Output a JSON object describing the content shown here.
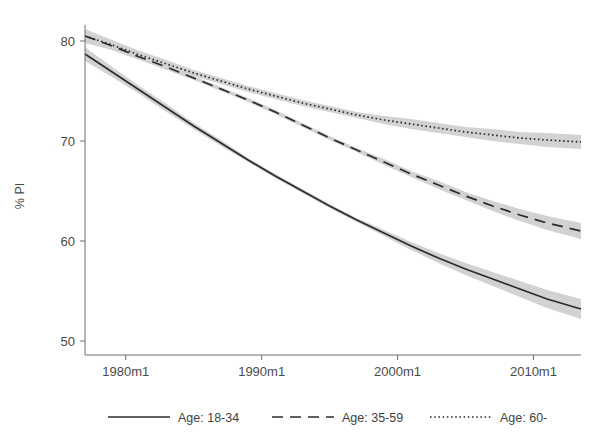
{
  "chart_data": {
    "type": "line",
    "title": "",
    "xlabel": "",
    "ylabel": "% PI",
    "xlim": [
      1977.0,
      2013.5
    ],
    "ylim": [
      48.6,
      81.6
    ],
    "grid": false,
    "legend_position": "bottom",
    "xticks": [
      "1980m1",
      "1990m1",
      "2000m1",
      "2010m1"
    ],
    "xtick_values": [
      1980,
      1990,
      2000,
      2010
    ],
    "yticks": [
      "50",
      "60",
      "70",
      "80"
    ],
    "ytick_values": [
      50,
      60,
      70,
      80
    ],
    "band_note": "shaded 95% confidence bands around each fitted line",
    "band_color": "#d2d2d2",
    "line_color": "#2b2b2b",
    "x": [
      1977.0,
      1979.0,
      1981.0,
      1983.0,
      1985.0,
      1987.0,
      1989.0,
      1991.0,
      1993.0,
      1995.0,
      1997.0,
      1999.0,
      2001.0,
      2003.0,
      2005.0,
      2007.0,
      2009.0,
      2011.0,
      2013.5
    ],
    "series": [
      {
        "name": "Age: 18-34",
        "style": "solid",
        "values": [
          78.7,
          76.9,
          75.1,
          73.3,
          71.5,
          69.8,
          68.1,
          66.5,
          65.0,
          63.5,
          62.1,
          60.8,
          59.5,
          58.3,
          57.2,
          56.2,
          55.2,
          54.2,
          53.2
        ],
        "ci_lower": [
          78.0,
          76.4,
          74.7,
          72.9,
          71.2,
          69.5,
          67.9,
          66.3,
          64.8,
          63.3,
          61.9,
          60.5,
          59.1,
          57.8,
          56.6,
          55.5,
          54.4,
          53.3,
          52.2
        ],
        "ci_upper": [
          79.4,
          77.4,
          75.5,
          73.7,
          71.8,
          70.1,
          68.3,
          66.7,
          65.2,
          63.7,
          62.3,
          61.1,
          59.9,
          58.8,
          57.8,
          56.9,
          56.0,
          55.1,
          54.2
        ]
      },
      {
        "name": "Age: 35-59",
        "style": "dashed",
        "values": [
          80.5,
          79.5,
          78.4,
          77.4,
          76.3,
          75.2,
          74.1,
          72.9,
          71.6,
          70.3,
          69.1,
          67.9,
          66.7,
          65.6,
          64.5,
          63.5,
          62.6,
          61.8,
          61.0
        ],
        "ci_lower": [
          79.9,
          79.1,
          78.1,
          77.1,
          76.1,
          75.0,
          73.9,
          72.7,
          71.4,
          70.1,
          68.9,
          67.6,
          66.4,
          65.2,
          64.1,
          63.0,
          62.0,
          61.1,
          60.2
        ],
        "ci_upper": [
          81.1,
          79.9,
          78.7,
          77.7,
          76.5,
          75.4,
          74.3,
          73.1,
          71.8,
          70.5,
          69.3,
          68.2,
          67.0,
          66.0,
          64.9,
          64.0,
          63.2,
          62.5,
          61.8
        ]
      },
      {
        "name": "Age: 60-",
        "style": "dotted",
        "values": [
          80.5,
          79.6,
          78.6,
          77.7,
          76.8,
          76.0,
          75.2,
          74.5,
          73.8,
          73.2,
          72.6,
          72.1,
          71.7,
          71.3,
          70.9,
          70.6,
          70.3,
          70.1,
          69.9
        ],
        "ci_lower": [
          79.8,
          79.1,
          78.2,
          77.3,
          76.5,
          75.7,
          74.9,
          74.2,
          73.5,
          72.9,
          72.3,
          71.7,
          71.2,
          70.8,
          70.4,
          70.0,
          69.7,
          69.4,
          69.2
        ],
        "ci_upper": [
          81.2,
          80.1,
          79.0,
          78.1,
          77.1,
          76.3,
          75.5,
          74.8,
          74.1,
          73.5,
          72.9,
          72.5,
          72.2,
          71.8,
          71.4,
          71.2,
          70.9,
          70.8,
          70.6
        ]
      }
    ]
  },
  "legend": {
    "items": [
      {
        "label": "Age: 18-34",
        "style": "solid"
      },
      {
        "label": "Age: 35-59",
        "style": "dashed"
      },
      {
        "label": "Age: 60-",
        "style": "dotted"
      }
    ]
  }
}
